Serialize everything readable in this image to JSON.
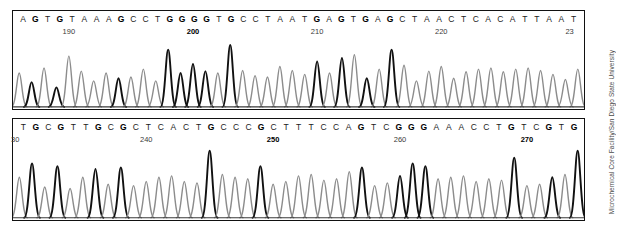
{
  "credit": {
    "text": "Microchemical Core Facility/San Diego State University"
  },
  "chart_data": {
    "type": "line",
    "title": "",
    "subtitle": "",
    "xlabel": "",
    "ylabel": "",
    "grid": false,
    "legend": null,
    "panels": [
      {
        "id": "panel-top",
        "name": "top-trace-panel",
        "position_start": 186,
        "position_end": 230,
        "ylim": [
          0,
          100
        ],
        "bases": [
          "A",
          "G",
          "T",
          "G",
          "T",
          "A",
          "A",
          "A",
          "G",
          "C",
          "C",
          "T",
          "G",
          "G",
          "G",
          "G",
          "T",
          "G",
          "C",
          "C",
          "T",
          "A",
          "A",
          "T",
          "G",
          "A",
          "G",
          "T",
          "G",
          "A",
          "G",
          "C",
          "T",
          "A",
          "A",
          "C",
          "T",
          "C",
          "A",
          "C",
          "A",
          "T",
          "T",
          "A",
          "A",
          "T"
        ],
        "peak_heights": [
          52,
          38,
          60,
          30,
          78,
          55,
          40,
          52,
          44,
          46,
          58,
          40,
          88,
          52,
          66,
          55,
          52,
          95,
          56,
          48,
          46,
          62,
          56,
          50,
          70,
          52,
          75,
          80,
          44,
          58,
          88,
          64,
          40,
          55,
          62,
          44,
          54,
          58,
          60,
          54,
          58,
          60,
          56,
          50,
          42,
          58
        ],
        "peak_dark": [
          false,
          true,
          false,
          true,
          false,
          false,
          false,
          false,
          true,
          false,
          false,
          false,
          true,
          true,
          true,
          true,
          false,
          true,
          false,
          false,
          false,
          false,
          false,
          false,
          true,
          false,
          true,
          false,
          true,
          false,
          true,
          false,
          false,
          false,
          false,
          false,
          false,
          false,
          false,
          false,
          false,
          false,
          false,
          false,
          false,
          false
        ],
        "ticks": [
          {
            "label": "190",
            "index": 4,
            "bold": false,
            "clipped": null
          },
          {
            "label": "200",
            "index": 14,
            "bold": true,
            "clipped": null
          },
          {
            "label": "210",
            "index": 24,
            "bold": false,
            "clipped": null
          },
          {
            "label": "220",
            "index": 34,
            "bold": false,
            "clipped": null
          },
          {
            "label": "23",
            "index": 44,
            "bold": false,
            "clipped": "right"
          }
        ]
      },
      {
        "id": "panel-bot",
        "name": "bottom-trace-panel",
        "position_start": 230,
        "position_end": 274,
        "ylim": [
          0,
          100
        ],
        "bases": [
          "T",
          "G",
          "C",
          "G",
          "T",
          "T",
          "G",
          "C",
          "G",
          "C",
          "T",
          "C",
          "A",
          "C",
          "T",
          "G",
          "C",
          "C",
          "C",
          "G",
          "C",
          "T",
          "T",
          "T",
          "C",
          "C",
          "A",
          "G",
          "T",
          "C",
          "G",
          "G",
          "G",
          "A",
          "A",
          "A",
          "C",
          "C",
          "T",
          "G",
          "T",
          "C",
          "G",
          "T",
          "G"
        ],
        "peak_heights": [
          58,
          78,
          44,
          74,
          42,
          58,
          70,
          48,
          72,
          46,
          52,
          58,
          60,
          52,
          50,
          96,
          62,
          58,
          56,
          74,
          48,
          52,
          60,
          62,
          54,
          56,
          66,
          72,
          46,
          50,
          60,
          78,
          74,
          56,
          58,
          60,
          52,
          56,
          54,
          86,
          46,
          48,
          58,
          62,
          96
        ],
        "peak_dark": [
          false,
          true,
          false,
          true,
          false,
          false,
          true,
          false,
          true,
          false,
          false,
          false,
          false,
          false,
          false,
          true,
          false,
          false,
          false,
          true,
          false,
          false,
          false,
          false,
          false,
          false,
          false,
          true,
          false,
          false,
          true,
          true,
          true,
          false,
          false,
          false,
          false,
          false,
          false,
          true,
          false,
          false,
          true,
          false,
          true
        ],
        "ticks": [
          {
            "label": "30",
            "index": 0,
            "bold": false,
            "clipped": "left"
          },
          {
            "label": "240",
            "index": 10,
            "bold": false,
            "clipped": null
          },
          {
            "label": "250",
            "index": 20,
            "bold": true,
            "clipped": null
          },
          {
            "label": "260",
            "index": 30,
            "bold": false,
            "clipped": null
          },
          {
            "label": "270",
            "index": 40,
            "bold": true,
            "clipped": null
          }
        ]
      }
    ]
  }
}
